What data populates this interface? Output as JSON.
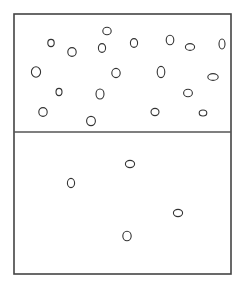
{
  "diagram": {
    "canvas": {
      "width": 244,
      "height": 285,
      "background": "#ffffff"
    },
    "container": {
      "x": 14,
      "y": 14,
      "width": 217,
      "height": 260,
      "stroke": "#444444",
      "stroke_width": 1.6
    },
    "divider": {
      "y": 132,
      "stroke": "#555555",
      "stroke_width": 1.4
    },
    "particle_style": {
      "stroke": "#333333",
      "stroke_width": 1.1,
      "fill": "none"
    },
    "regions": [
      {
        "name": "upper-region",
        "particles": [
          {
            "cx": 51,
            "cy": 43,
            "rx": 3.2,
            "ry": 3.6
          },
          {
            "cx": 107,
            "cy": 31,
            "rx": 4.2,
            "ry": 3.8
          },
          {
            "cx": 72,
            "cy": 52,
            "rx": 4.2,
            "ry": 4.4
          },
          {
            "cx": 102,
            "cy": 48,
            "rx": 3.6,
            "ry": 4.4
          },
          {
            "cx": 134,
            "cy": 43,
            "rx": 3.6,
            "ry": 4.4
          },
          {
            "cx": 170,
            "cy": 40,
            "rx": 3.8,
            "ry": 4.8
          },
          {
            "cx": 190,
            "cy": 47,
            "rx": 4.6,
            "ry": 3.4
          },
          {
            "cx": 222,
            "cy": 44,
            "rx": 3.0,
            "ry": 5.0
          },
          {
            "cx": 36,
            "cy": 72,
            "rx": 4.6,
            "ry": 5.2
          },
          {
            "cx": 116,
            "cy": 73,
            "rx": 4.2,
            "ry": 4.6
          },
          {
            "cx": 161,
            "cy": 72,
            "rx": 3.8,
            "ry": 5.6
          },
          {
            "cx": 213,
            "cy": 77,
            "rx": 5.2,
            "ry": 3.4
          },
          {
            "cx": 59,
            "cy": 92,
            "rx": 3.0,
            "ry": 3.6
          },
          {
            "cx": 100,
            "cy": 94,
            "rx": 4.0,
            "ry": 5.0
          },
          {
            "cx": 188,
            "cy": 93,
            "rx": 4.4,
            "ry": 3.8
          },
          {
            "cx": 43,
            "cy": 112,
            "rx": 4.2,
            "ry": 4.4
          },
          {
            "cx": 155,
            "cy": 112,
            "rx": 4.0,
            "ry": 3.6
          },
          {
            "cx": 203,
            "cy": 113,
            "rx": 3.8,
            "ry": 3.0
          },
          {
            "cx": 91,
            "cy": 121,
            "rx": 4.4,
            "ry": 4.6
          }
        ]
      },
      {
        "name": "lower-region",
        "particles": [
          {
            "cx": 130,
            "cy": 164,
            "rx": 4.6,
            "ry": 3.6
          },
          {
            "cx": 71,
            "cy": 183,
            "rx": 3.6,
            "ry": 4.6
          },
          {
            "cx": 178,
            "cy": 213,
            "rx": 4.6,
            "ry": 3.6
          },
          {
            "cx": 127,
            "cy": 236,
            "rx": 4.2,
            "ry": 4.8
          }
        ]
      }
    ]
  }
}
